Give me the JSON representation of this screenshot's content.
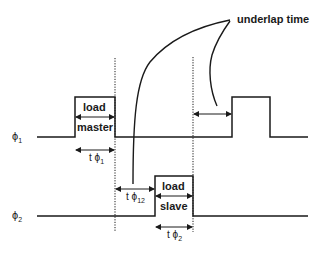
{
  "signals": [
    {
      "name": "phi1",
      "label": "ϕ",
      "sub": "1"
    },
    {
      "name": "phi2",
      "label": "ϕ",
      "sub": "2"
    }
  ],
  "pulse_labels": {
    "master_top": "load",
    "master_bottom": "master",
    "slave_top": "load",
    "slave_bottom": "slave"
  },
  "intervals": {
    "t_phi1": {
      "t": "t",
      "phi": "ϕ",
      "sub": "1"
    },
    "t_phi12": {
      "t": "t",
      "phi": "ϕ",
      "sub": "12"
    },
    "t_phi2": {
      "t": "t",
      "phi": "ϕ",
      "sub": "2"
    }
  },
  "annotation": "underlap time",
  "colors": {
    "line": "#1a1a1a",
    "background": "#ffffff"
  }
}
